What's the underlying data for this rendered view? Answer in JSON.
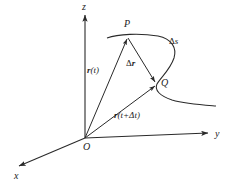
{
  "figure": {
    "background_color": "#ffffff",
    "stroke_color": "#2a2a2a",
    "axes": [
      {
        "name": "x",
        "label": "x",
        "label_x": 14,
        "label_y": 172
      },
      {
        "name": "y",
        "label": "y",
        "label_x": 216,
        "label_y": 130
      },
      {
        "name": "z",
        "label": "z",
        "label_x": 82,
        "label_y": 3
      }
    ],
    "points": [
      {
        "name": "origin",
        "label": "O",
        "label_x": 83,
        "label_y": 143,
        "px": 85,
        "py": 138
      },
      {
        "name": "point-p",
        "label": "P",
        "label_x": 124,
        "label_y": 20,
        "px": 128,
        "py": 36
      },
      {
        "name": "point-q",
        "label": "Q",
        "label_x": 161,
        "label_y": 79,
        "px": 157,
        "py": 84
      }
    ],
    "vectors": [
      {
        "name": "vector-r-t",
        "label_html": "<b>r</b>(<i>t</i>)",
        "label_x": 87,
        "label_y": 67,
        "from": "origin",
        "to": "point-p"
      },
      {
        "name": "vector-r-t-plus-dt",
        "label_html": "<b>r</b>(<i>t</i>+Δ<i>t</i>)",
        "label_x": 117,
        "label_y": 112,
        "from": "origin",
        "to": "point-q"
      },
      {
        "name": "vector-delta-r",
        "label_html": "Δ<b>r</b>",
        "label_x": 126,
        "label_y": 60,
        "from": "point-p",
        "to": "point-q"
      }
    ],
    "arc": {
      "name": "arc-delta-s",
      "label_html": "Δ<i>s</i>",
      "label_x": 170,
      "label_y": 38,
      "description": "arc length along the curve from P to Q"
    },
    "curve": {
      "name": "space-curve",
      "path": "M 107,38 C 118,34 140,33 158,36 C 172,39 177,48 174,58 C 170,70 161,77 157,84 C 154,90 160,96 172,100 C 186,104 203,105 216,106"
    }
  }
}
